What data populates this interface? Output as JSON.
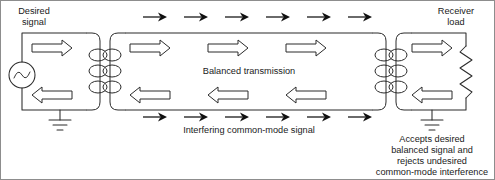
{
  "figure": {
    "width": 495,
    "height": 180,
    "background_color": "#ffffff",
    "line_color": "#2b2b2b",
    "text_color": "#1a1a1a"
  },
  "labels": {
    "desired_signal_line1": "Desired",
    "desired_signal_line2": "signal",
    "receiver_load_line1": "Receiver",
    "receiver_load_line2": "load",
    "balanced_transmission": "Balanced transmission",
    "interfering_signal": "Interfering common-mode signal",
    "note_line1": "Accepts desired",
    "note_line2": "balanced signal and",
    "note_line3": "rejects undesired",
    "note_line4": "common-mode interference"
  },
  "components": {
    "source": {
      "name": "ac-source",
      "symbol": "sine-wave-circle",
      "cx": 22,
      "cy": 75,
      "r": 13
    },
    "load": {
      "name": "resistor",
      "symbol": "zigzag",
      "x": 466,
      "y_top": 46,
      "y_bottom": 98,
      "zigzag_count": 5
    },
    "transformers": [
      {
        "name": "sending-transformer",
        "primary_x": 92,
        "secondary_x": 110,
        "turns": 3
      },
      {
        "name": "receiving-transformer",
        "primary_x": 378,
        "secondary_x": 396,
        "turns": 3
      }
    ],
    "grounds": [
      {
        "name": "source-ground",
        "x": 60,
        "y": 104,
        "bars": 3
      },
      {
        "name": "receiver-ground",
        "x": 432,
        "y": 104,
        "bars": 3
      }
    ]
  },
  "signal_arrows": {
    "differential_forward": {
      "count": 3,
      "direction": "right",
      "style": "hollow",
      "y": 48,
      "x_positions": [
        150,
        228,
        306
      ]
    },
    "differential_return": {
      "count": 3,
      "direction": "left",
      "style": "hollow",
      "y": 95,
      "x_positions": [
        150,
        228,
        306
      ]
    },
    "source_forward": {
      "count": 1,
      "direction": "right",
      "style": "hollow",
      "y": 48,
      "x_positions": [
        52
      ]
    },
    "source_return": {
      "count": 1,
      "direction": "left",
      "style": "hollow",
      "y": 95,
      "x_positions": [
        52
      ]
    },
    "load_forward": {
      "count": 1,
      "direction": "right",
      "style": "hollow",
      "y": 48,
      "x_positions": [
        432
      ]
    },
    "load_return": {
      "count": 1,
      "direction": "left",
      "style": "hollow",
      "y": 95,
      "x_positions": [
        432
      ]
    },
    "common_mode_top": {
      "count": 6,
      "direction": "right",
      "style": "solid",
      "y": 17,
      "x_positions": [
        152,
        193,
        234,
        275,
        316,
        357
      ]
    },
    "common_mode_bottom": {
      "count": 6,
      "direction": "right",
      "style": "solid",
      "y": 117,
      "x_positions": [
        152,
        193,
        234,
        275,
        316,
        357
      ]
    }
  }
}
